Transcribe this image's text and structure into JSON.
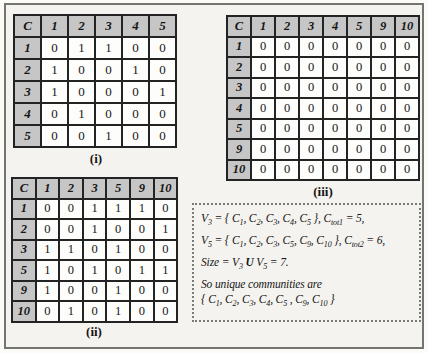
{
  "colors": {
    "page_bg": "#f4f3ef",
    "frame": "#75746f",
    "header_bg": "#c6c6c6",
    "table_border": "#232323",
    "note_border": "#7a7a76"
  },
  "tables": [
    {
      "id": "i",
      "caption": "(i)",
      "corner": "C",
      "col_headers": [
        "1",
        "2",
        "3",
        "4",
        "5"
      ],
      "rows": [
        {
          "label": "1",
          "cells": [
            "0",
            "1",
            "1",
            "0",
            "0"
          ]
        },
        {
          "label": "2",
          "cells": [
            "1",
            "0",
            "0",
            "1",
            "0"
          ]
        },
        {
          "label": "3",
          "cells": [
            "1",
            "0",
            "0",
            "0",
            "1"
          ]
        },
        {
          "label": "4",
          "cells": [
            "0",
            "1",
            "0",
            "0",
            "0"
          ]
        },
        {
          "label": "5",
          "cells": [
            "0",
            "0",
            "1",
            "0",
            "0"
          ]
        }
      ]
    },
    {
      "id": "ii",
      "caption": "(ii)",
      "corner": "C",
      "col_headers": [
        "1",
        "2",
        "3",
        "5",
        "9",
        "10"
      ],
      "rows": [
        {
          "label": "1",
          "cells": [
            "0",
            "0",
            "1",
            "1",
            "1",
            "0"
          ]
        },
        {
          "label": "2",
          "cells": [
            "0",
            "0",
            "1",
            "0",
            "0",
            "1"
          ]
        },
        {
          "label": "3",
          "cells": [
            "1",
            "1",
            "0",
            "1",
            "0",
            "0"
          ]
        },
        {
          "label": "5",
          "cells": [
            "1",
            "0",
            "1",
            "0",
            "1",
            "1"
          ]
        },
        {
          "label": "9",
          "cells": [
            "1",
            "0",
            "0",
            "1",
            "0",
            "0"
          ]
        },
        {
          "label": "10",
          "cells": [
            "0",
            "1",
            "0",
            "1",
            "0",
            "0"
          ]
        }
      ]
    },
    {
      "id": "iii",
      "caption": "(iii)",
      "corner": "C",
      "col_headers": [
        "1",
        "2",
        "3",
        "4",
        "5",
        "9",
        "10"
      ],
      "rows": [
        {
          "label": "1",
          "cells": [
            "0",
            "0",
            "0",
            "0",
            "0",
            "0",
            "0"
          ]
        },
        {
          "label": "2",
          "cells": [
            "0",
            "0",
            "0",
            "0",
            "0",
            "0",
            "0"
          ]
        },
        {
          "label": "3",
          "cells": [
            "0",
            "0",
            "0",
            "0",
            "0",
            "0",
            "0"
          ]
        },
        {
          "label": "4",
          "cells": [
            "0",
            "0",
            "0",
            "0",
            "0",
            "0",
            "0"
          ]
        },
        {
          "label": "5",
          "cells": [
            "0",
            "0",
            "0",
            "0",
            "0",
            "0",
            "0"
          ]
        },
        {
          "label": "9",
          "cells": [
            "0",
            "0",
            "0",
            "0",
            "0",
            "0",
            "0"
          ]
        },
        {
          "label": "10",
          "cells": [
            "0",
            "0",
            "0",
            "0",
            "0",
            "0",
            "0"
          ]
        }
      ]
    }
  ],
  "note": {
    "lines": [
      "V_{3} = { C_{1}, C_{2}, C_{3}, C_{4}, C_{5} }, C_{tot1} = 5,",
      "V_{5} = { C_{1}, C_{2}, C_{3}, C_{5}, C_{9}, C_{10} }, C_{tot2} = 6,",
      "Size =  V_{3} *U* V_{5}  = 7.",
      "So unique communities are",
      "{ C_{1}, C_{2}, C_{3}, C_{4}, C_{5} , C_{9}, C_{10} }"
    ]
  }
}
